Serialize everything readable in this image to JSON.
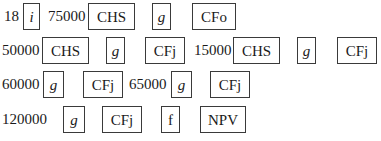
{
  "rows": [
    {
      "items": [
        {
          "type": "num",
          "text": "18",
          "x": 4,
          "w": 18
        },
        {
          "type": "key",
          "text": "i",
          "italic": true,
          "x": 23,
          "w": 17
        },
        {
          "type": "num",
          "text": "75000",
          "x": 48,
          "w": 40
        },
        {
          "type": "key",
          "text": "CHS",
          "x": 88,
          "w": 47
        },
        {
          "type": "key",
          "text": "g",
          "italic": true,
          "x": 152,
          "w": 19
        },
        {
          "type": "key",
          "text": "CFo",
          "x": 192,
          "w": 44
        }
      ]
    },
    {
      "items": [
        {
          "type": "num",
          "text": "50000",
          "x": 2,
          "w": 40
        },
        {
          "type": "key",
          "text": "CHS",
          "x": 42,
          "w": 47
        },
        {
          "type": "key",
          "text": "g",
          "italic": true,
          "x": 106,
          "w": 19
        },
        {
          "type": "key",
          "text": "CFj",
          "x": 145,
          "w": 40
        },
        {
          "type": "num",
          "text": "15000",
          "x": 194,
          "w": 40
        },
        {
          "type": "key",
          "text": "CHS",
          "x": 233,
          "w": 47
        },
        {
          "type": "key",
          "text": "g",
          "italic": true,
          "x": 297,
          "w": 19
        },
        {
          "type": "key",
          "text": "CFj",
          "x": 337,
          "w": 40
        }
      ]
    },
    {
      "items": [
        {
          "type": "num",
          "text": "60000",
          "x": 2,
          "w": 40
        },
        {
          "type": "key",
          "text": "g",
          "italic": true,
          "x": 43,
          "w": 21
        },
        {
          "type": "key",
          "text": "CFj",
          "x": 83,
          "w": 40
        },
        {
          "type": "num",
          "text": "65000",
          "x": 129,
          "w": 40
        },
        {
          "type": "key",
          "text": "g",
          "italic": true,
          "x": 171,
          "w": 21
        },
        {
          "type": "key",
          "text": "CFj",
          "x": 210,
          "w": 40
        }
      ]
    },
    {
      "items": [
        {
          "type": "num",
          "text": "120000",
          "x": 2,
          "w": 48
        },
        {
          "type": "key",
          "text": "g",
          "italic": true,
          "x": 63,
          "w": 22
        },
        {
          "type": "key",
          "text": "CFj",
          "x": 102,
          "w": 40
        },
        {
          "type": "key",
          "text": "f",
          "x": 161,
          "w": 19
        },
        {
          "type": "key",
          "text": "NPV",
          "x": 200,
          "w": 46
        }
      ]
    }
  ],
  "row_tops": [
    3,
    37,
    71,
    106
  ]
}
